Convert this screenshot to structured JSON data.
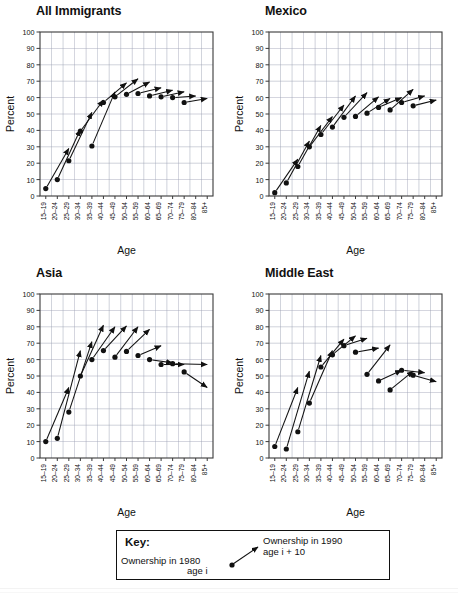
{
  "figure": {
    "axis_x_label": "Age",
    "axis_y_label": "Percent",
    "y_ticks": [
      0,
      10,
      20,
      30,
      40,
      50,
      60,
      70,
      80,
      90,
      100
    ],
    "x_categories": [
      "15–19",
      "20–24",
      "25–29",
      "30–34",
      "35–39",
      "40–44",
      "45–49",
      "50–54",
      "55–59",
      "60–64",
      "65–69",
      "70–74",
      "75–79",
      "80–84",
      "85+"
    ],
    "marker_color": "#111111",
    "line_color": "#111111",
    "grid_color": "#9aa0b4",
    "frame_color": "#3a3a3a"
  },
  "key": {
    "title": "Key:",
    "start_line1": "Ownership in 1980",
    "start_line2": "age i",
    "end_line1": "Ownership in 1990",
    "end_line2": "age i + 10"
  },
  "chart_data": [
    {
      "type": "scatter",
      "title": "All Immigrants",
      "xlabel": "Age",
      "ylabel": "Percent",
      "ylim": [
        0,
        100
      ],
      "grid": true,
      "legend": "none",
      "categories": [
        "15–19",
        "20–24",
        "25–29",
        "30–34",
        "35–39",
        "40–44",
        "45–49",
        "50–54",
        "55–59",
        "60–64",
        "65–69",
        "70–74",
        "75–79",
        "80–84",
        "85+"
      ],
      "series": [
        {
          "name": "1980 ownership (dot) → 1990 ownership age i+10 (arrow tip)",
          "points": [
            {
              "age": "15–19",
              "y1980": 4.5,
              "age_1990": "25–29",
              "y1990": 29.0
            },
            {
              "age": "20–24",
              "y1980": 10.0,
              "age_1990": "30–34",
              "y1990": 40.5
            },
            {
              "age": "25–29",
              "y1980": 21.5,
              "age_1990": "35–39",
              "y1990": 51.0
            },
            {
              "age": "30–34",
              "y1980": 39.5,
              "age_1990": "40–44",
              "y1990": 58.5
            },
            {
              "age": "35–39",
              "y1980": 30.5,
              "age_1990": "45–49",
              "y1990": 63.5
            },
            {
              "age": "40–44",
              "y1980": 57.0,
              "age_1990": "50–54",
              "y1990": 69.0
            },
            {
              "age": "45–49",
              "y1980": 60.5,
              "age_1990": "55–59",
              "y1990": 71.5
            },
            {
              "age": "50–54",
              "y1980": 62.0,
              "age_1990": "60–64",
              "y1990": 69.5
            },
            {
              "age": "55–59",
              "y1980": 62.5,
              "age_1990": "65–69",
              "y1990": 66.0
            },
            {
              "age": "60–64",
              "y1980": 61.0,
              "age_1990": "70–74",
              "y1990": 64.5
            },
            {
              "age": "65–69",
              "y1980": 60.5,
              "age_1990": "75–79",
              "y1990": 63.5
            },
            {
              "age": "70–74",
              "y1980": 60.0,
              "age_1990": "80–84",
              "y1990": 61.0
            },
            {
              "age": "75–79",
              "y1980": 57.0,
              "age_1990": "85+",
              "y1990": 59.5
            }
          ]
        }
      ]
    },
    {
      "type": "scatter",
      "title": "Mexico",
      "xlabel": "Age",
      "ylabel": "Percent",
      "ylim": [
        0,
        100
      ],
      "grid": true,
      "legend": "none",
      "categories": [
        "15–19",
        "20–24",
        "25–29",
        "30–34",
        "35–39",
        "40–44",
        "45–49",
        "50–54",
        "55–59",
        "60–64",
        "65–69",
        "70–74",
        "75–79",
        "80–84",
        "85+"
      ],
      "series": [
        {
          "name": "1980 ownership (dot) → 1990 ownership age i+10 (arrow tip)",
          "points": [
            {
              "age": "15–19",
              "y1980": 2.0,
              "age_1990": "25–29",
              "y1990": 22.5
            },
            {
              "age": "20–24",
              "y1980": 8.0,
              "age_1990": "30–34",
              "y1990": 33.5
            },
            {
              "age": "25–29",
              "y1980": 18.0,
              "age_1990": "35–39",
              "y1990": 43.0
            },
            {
              "age": "30–34",
              "y1980": 30.0,
              "age_1990": "40–44",
              "y1990": 48.5
            },
            {
              "age": "35–39",
              "y1980": 37.5,
              "age_1990": "45–49",
              "y1990": 55.5
            },
            {
              "age": "40–44",
              "y1980": 42.0,
              "age_1990": "50–54",
              "y1990": 61.0
            },
            {
              "age": "45–49",
              "y1980": 48.0,
              "age_1990": "55–59",
              "y1990": 63.0
            },
            {
              "age": "50–54",
              "y1980": 48.5,
              "age_1990": "60–64",
              "y1990": 60.5
            },
            {
              "age": "55–59",
              "y1980": 50.5,
              "age_1990": "65–69",
              "y1990": 59.5
            },
            {
              "age": "60–64",
              "y1980": 54.0,
              "age_1990": "70–74",
              "y1990": 60.0
            },
            {
              "age": "65–69",
              "y1980": 52.5,
              "age_1990": "75–79",
              "y1990": 65.0
            },
            {
              "age": "70–74",
              "y1980": 57.0,
              "age_1990": "80–84",
              "y1990": 61.0
            },
            {
              "age": "75–79",
              "y1980": 55.0,
              "age_1990": "85+",
              "y1990": 58.5
            }
          ]
        }
      ]
    },
    {
      "type": "scatter",
      "title": "Asia",
      "xlabel": "Age",
      "ylabel": "Percent",
      "ylim": [
        0,
        100
      ],
      "grid": true,
      "legend": "none",
      "categories": [
        "15–19",
        "20–24",
        "25–29",
        "30–34",
        "35–39",
        "40–44",
        "45–49",
        "50–54",
        "55–59",
        "60–64",
        "65–69",
        "70–74",
        "75–79",
        "80–84",
        "85+"
      ],
      "series": [
        {
          "name": "1980 ownership (dot) → 1990 ownership age i+10 (arrow tip)",
          "points": [
            {
              "age": "15–19",
              "y1980": 10.0,
              "age_1990": "25–29",
              "y1990": 43.0
            },
            {
              "age": "20–24",
              "y1980": 12.0,
              "age_1990": "30–34",
              "y1990": 65.5
            },
            {
              "age": "25–29",
              "y1980": 28.0,
              "age_1990": "35–39",
              "y1990": 71.0
            },
            {
              "age": "30–34",
              "y1980": 50.0,
              "age_1990": "40–44",
              "y1990": 81.0
            },
            {
              "age": "35–39",
              "y1980": 60.0,
              "age_1990": "45–49",
              "y1990": 80.0
            },
            {
              "age": "40–44",
              "y1980": 65.5,
              "age_1990": "50–54",
              "y1990": 80.5
            },
            {
              "age": "45–49",
              "y1980": 61.5,
              "age_1990": "55–59",
              "y1990": 80.0
            },
            {
              "age": "50–54",
              "y1980": 65.0,
              "age_1990": "60–64",
              "y1990": 78.5
            },
            {
              "age": "55–59",
              "y1980": 62.5,
              "age_1990": "65–69",
              "y1990": 68.5
            },
            {
              "age": "60–64",
              "y1980": 60.0,
              "age_1990": "70–74",
              "y1990": 58.0
            },
            {
              "age": "65–69",
              "y1980": 57.0,
              "age_1990": "75–79",
              "y1990": 57.0
            },
            {
              "age": "70–74",
              "y1980": 57.5,
              "age_1990": "85+",
              "y1990": 57.0
            },
            {
              "age": "75–79",
              "y1980": 52.5,
              "age_1990": "85+",
              "y1990": 43.0
            }
          ]
        }
      ]
    },
    {
      "type": "scatter",
      "title": "Middle East",
      "xlabel": "Age",
      "ylabel": "Percent",
      "ylim": [
        0,
        100
      ],
      "grid": true,
      "legend": "none",
      "categories": [
        "15–19",
        "20–24",
        "25–29",
        "30–34",
        "35–39",
        "40–44",
        "45–49",
        "50–54",
        "55–59",
        "60–64",
        "65–69",
        "70–74",
        "75–79",
        "80–84",
        "85+"
      ],
      "series": [
        {
          "name": "1980 ownership (dot) → 1990 ownership age i+10 (arrow tip)",
          "points": [
            {
              "age": "15–19",
              "y1980": 7.0,
              "age_1990": "25–29",
              "y1990": 43.0
            },
            {
              "age": "20–24",
              "y1980": 5.5,
              "age_1990": "30–34",
              "y1990": 53.0
            },
            {
              "age": "25–29",
              "y1980": 16.0,
              "age_1990": "35–39",
              "y1990": 62.5
            },
            {
              "age": "30–34",
              "y1980": 33.5,
              "age_1990": "40–44",
              "y1990": 65.5
            },
            {
              "age": "35–39",
              "y1980": 55.5,
              "age_1990": "45–49",
              "y1990": 72.5
            },
            {
              "age": "40–44",
              "y1980": 63.0,
              "age_1990": "50–54",
              "y1990": 74.5
            },
            {
              "age": "45–49",
              "y1980": 68.5,
              "age_1990": "55–59",
              "y1990": 73.0
            },
            {
              "age": "50–54",
              "y1980": 64.5,
              "age_1990": "60–64",
              "y1990": 67.0
            },
            {
              "age": "55–59",
              "y1980": 51.0,
              "age_1990": "65–69",
              "y1990": 69.0
            },
            {
              "age": "60–64",
              "y1980": 47.0,
              "age_1990": "70–74",
              "y1990": 53.5
            },
            {
              "age": "65–69",
              "y1980": 41.5,
              "age_1990": "75–79",
              "y1990": 53.0
            },
            {
              "age": "70–74",
              "y1980": 53.5,
              "age_1990": "80–84",
              "y1990": 52.0
            },
            {
              "age": "75–79",
              "y1980": 50.5,
              "age_1990": "85+",
              "y1990": 46.5
            }
          ]
        }
      ]
    }
  ]
}
